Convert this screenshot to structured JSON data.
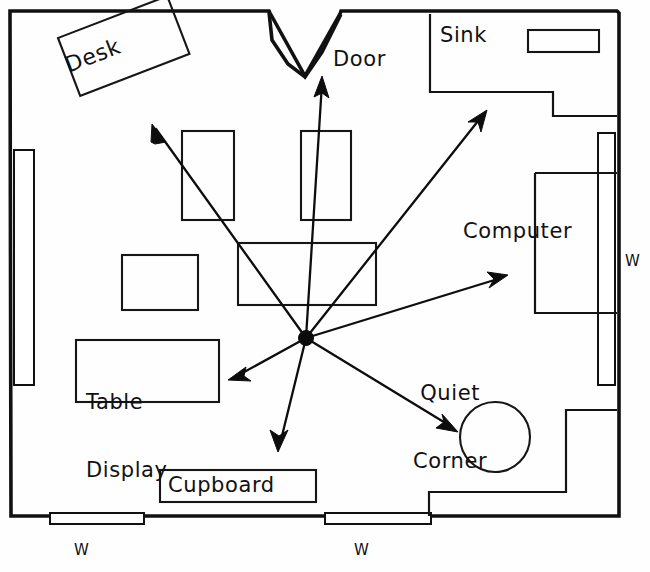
{
  "diagram": {
    "type": "hand-drawn-floor-plan",
    "canvas": {
      "width": 650,
      "height": 572
    },
    "ink_color": "#111111",
    "paper_color": "#fefefe"
  },
  "labels": {
    "desk": "Desk",
    "door": "Door",
    "sink": "Sink",
    "computer": "Computer",
    "quiet_corner_line1": "Quiet",
    "quiet_corner_line2": "Corner",
    "table_display_line1": "Table",
    "table_display_line2": "Display",
    "cupboard": "Cupboard",
    "window_right": "W",
    "window_bottom_left": "W",
    "window_bottom_middle": "W"
  },
  "zones": [
    {
      "name": "desk",
      "label": "Desk",
      "shape": "rotated-rectangle",
      "rotation_deg": -21
    },
    {
      "name": "door",
      "label": "Door",
      "shape": "v-notch-opening",
      "wall": "top"
    },
    {
      "name": "sink",
      "label": "Sink",
      "shape": "stepped-counter",
      "wall": "top-right"
    },
    {
      "name": "computer",
      "label": "Computer",
      "shape": "rectangle",
      "wall": "right"
    },
    {
      "name": "quiet-corner",
      "label": "Quiet Corner",
      "shape": "circle"
    },
    {
      "name": "table-display",
      "label": "Table Display",
      "shape": "rectangle"
    },
    {
      "name": "cupboard",
      "label": "Cupboard",
      "shape": "rectangle",
      "wall": "bottom"
    }
  ],
  "windows": [
    {
      "name": "window-left-wall",
      "label": "",
      "wall": "left"
    },
    {
      "name": "window-right-wall",
      "label": "W",
      "wall": "right"
    },
    {
      "name": "window-bottom-left",
      "label": "W",
      "wall": "bottom"
    },
    {
      "name": "window-bottom-middle",
      "label": "W",
      "wall": "bottom"
    }
  ],
  "sightlines": {
    "origin_label": "observation point",
    "origin": {
      "x": 306,
      "y": 338
    },
    "rays": [
      {
        "name": "ray-to-desk",
        "target": "Desk",
        "tip": {
          "x": 152,
          "y": 124
        }
      },
      {
        "name": "ray-to-door",
        "target": "Door",
        "tip": {
          "x": 322,
          "y": 76
        }
      },
      {
        "name": "ray-to-sink",
        "target": "Sink",
        "tip": {
          "x": 487,
          "y": 110
        }
      },
      {
        "name": "ray-to-computer",
        "target": "Computer",
        "tip": {
          "x": 508,
          "y": 275
        }
      },
      {
        "name": "ray-to-quiet-corner",
        "target": "Quiet Corner",
        "tip": {
          "x": 458,
          "y": 432
        }
      },
      {
        "name": "ray-to-cupboard",
        "target": "Cupboard",
        "tip": {
          "x": 278,
          "y": 452
        }
      },
      {
        "name": "ray-to-table-display",
        "target": "Table Display",
        "tip": {
          "x": 228,
          "y": 380
        }
      }
    ]
  },
  "furniture_blocks": [
    {
      "name": "table-upper-left",
      "x": 182,
      "y": 131,
      "width": 52,
      "height": 89
    },
    {
      "name": "table-upper-right",
      "x": 301,
      "y": 131,
      "width": 50,
      "height": 89
    },
    {
      "name": "table-mid-left",
      "x": 122,
      "y": 255,
      "width": 76,
      "height": 55
    },
    {
      "name": "table-central",
      "x": 238,
      "y": 243,
      "width": 138,
      "height": 62
    }
  ]
}
